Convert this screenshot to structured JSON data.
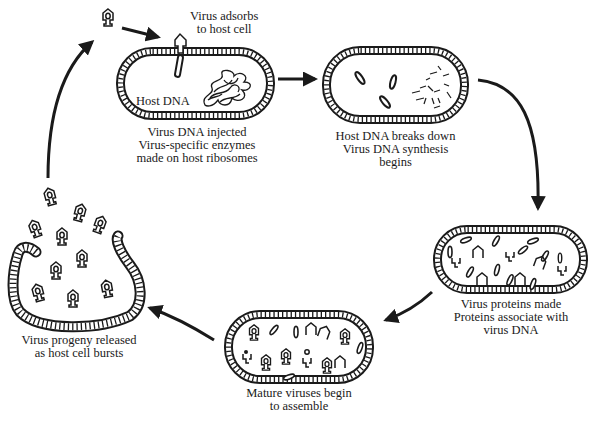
{
  "diagram": {
    "colors": {
      "ink": "#1a1a1a",
      "background": "#ffffff"
    },
    "stages": [
      {
        "id": "adsorb",
        "label_lines": [
          "Virus adsorbs",
          "to host cell"
        ]
      },
      {
        "id": "inject",
        "inner_label": "Host DNA",
        "label_lines": [
          "Virus DNA injected",
          "Virus-specific enzymes",
          "made on host ribosomes"
        ]
      },
      {
        "id": "synthesis",
        "label_lines": [
          "Host DNA breaks down",
          "Virus DNA synthesis",
          "begins"
        ]
      },
      {
        "id": "proteins",
        "label_lines": [
          "Virus proteins made",
          "Proteins associate with",
          "virus DNA"
        ]
      },
      {
        "id": "assemble",
        "label_lines": [
          "Mature viruses begin",
          "to assemble"
        ]
      },
      {
        "id": "release",
        "label_lines": [
          "Virus progeny released",
          "as host cell bursts"
        ]
      }
    ],
    "arrows": [
      {
        "from": "free-virus",
        "to": "adsorb"
      },
      {
        "from": "inject",
        "to": "synthesis"
      },
      {
        "from": "synthesis",
        "to": "proteins"
      },
      {
        "from": "proteins",
        "to": "assemble"
      },
      {
        "from": "assemble",
        "to": "release"
      },
      {
        "from": "release",
        "to": "free-virus"
      }
    ]
  }
}
